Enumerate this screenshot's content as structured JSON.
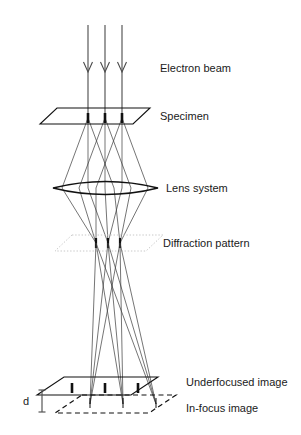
{
  "figure": {
    "type": "optical-ray-diagram",
    "background_color": "#ffffff",
    "width": 301,
    "height": 435
  },
  "labels": {
    "electron_beam": "Electron beam",
    "specimen": "Specimen",
    "lens_system": "Lens system",
    "diffraction_pattern": "Diffraction pattern",
    "underfocused_image": "Underfocused image",
    "in_focus_image": "In-focus image",
    "defocus_distance": "d"
  },
  "elements": {
    "beam": {
      "name": "electron-beam",
      "ray_count": 3,
      "x_positions": [
        88,
        105,
        122
      ],
      "y_top": 25,
      "y_bottom": 118,
      "arrow_y": 62,
      "color": "#4a4a4a"
    },
    "specimen_plane": {
      "name": "specimen-plane",
      "style": "solid",
      "color": "#111111",
      "points": [
        57,
        108,
        150,
        108,
        133,
        124,
        40,
        124
      ],
      "spots": [
        88,
        105,
        122
      ],
      "spot_y": 118
    },
    "lens": {
      "name": "lens-system",
      "style": "biconvex",
      "color": "#111111",
      "x_left": 53,
      "x_right": 158,
      "y_center": 188,
      "bulge": 13
    },
    "diffraction_plane": {
      "name": "diffraction-plane",
      "style": "dotted",
      "color": "#c8c8c8",
      "points": [
        72,
        235,
        163,
        235,
        146,
        251,
        55,
        251
      ],
      "spots": [
        96,
        108,
        120
      ],
      "spot_y": 243
    },
    "underfocused_plane": {
      "name": "underfocused-image-plane",
      "style": "solid",
      "color": "#111111",
      "points": [
        64,
        377,
        158,
        377,
        131,
        395,
        37,
        395
      ],
      "spots": [
        72,
        105,
        138
      ],
      "spot_y": 388
    },
    "in_focus_plane": {
      "name": "in-focus-image-plane",
      "style": "dashed",
      "color": "#111111",
      "points": [
        82,
        395,
        176,
        395,
        149,
        413,
        55,
        413
      ],
      "spots": [
        90,
        123,
        156
      ],
      "spot_y": 404
    },
    "defocus_dimension": {
      "name": "defocus-dimension-bar",
      "x": 42,
      "y_top": 390,
      "y_bottom": 412,
      "cap_width": 5,
      "label_x": 26,
      "label_y": 404
    }
  },
  "label_positions": {
    "electron_beam": {
      "x": 160,
      "y": 68
    },
    "specimen": {
      "x": 160,
      "y": 116
    },
    "lens_system": {
      "x": 166,
      "y": 191
    },
    "diffraction_pattern": {
      "x": 163,
      "y": 244
    },
    "underfocused_image": {
      "x": 186,
      "y": 382
    },
    "in_focus_image": {
      "x": 186,
      "y": 408
    }
  },
  "ray_paths": {
    "description": "Three object points on the specimen each emit a 3-ray fan; rays converge through the lens to diffraction spots, cross, then focus at the in-focus plane, intercepted early by the underfocused plane.",
    "object_points_x": [
      88,
      105,
      122
    ],
    "diffraction_points_x": [
      96,
      108,
      120
    ],
    "image_points_x": [
      90,
      123,
      156
    ],
    "underfocus_points_x": [
      72,
      105,
      138
    ],
    "y_specimen": 118,
    "y_lens": 188,
    "y_diffraction": 243,
    "y_underfocus": 388,
    "y_infocus": 404
  }
}
